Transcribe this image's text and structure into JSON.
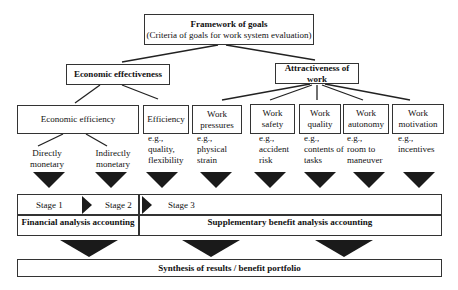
{
  "top": {
    "title": "Framework of goals",
    "subtitle": "(Criteria of goals for work system evaluation)"
  },
  "level2": {
    "left": "Economic effectiveness",
    "right": "Attractiveness of work"
  },
  "level3": [
    {
      "label": "Economic efficiency"
    },
    {
      "label": "Efficiency",
      "example_prefix": "e.g.,",
      "example": "quality, flexibility"
    },
    {
      "label": "Work pressures",
      "example_prefix": "e.g.,",
      "example": "physical strain"
    },
    {
      "label": "Work safety",
      "example_prefix": "e.g.,",
      "example": "accident risk"
    },
    {
      "label": "Work quality",
      "example_prefix": "e.g.,",
      "example": "contents of tasks"
    },
    {
      "label": "Work autonomy",
      "example_prefix": "e.g.,",
      "example": "room to maneuver"
    },
    {
      "label": "Work motivation",
      "example_prefix": "e.g.,",
      "example": "incentives"
    }
  ],
  "econ_sub": {
    "direct": "Directly monetary",
    "indirect": "Indirectly monetary"
  },
  "stages": {
    "stage1": "Stage 1",
    "stage2": "Stage 2",
    "stage3": "Stage 3",
    "financial": "Financial analysis accounting",
    "supplementary": "Supplementary benefit analysis accounting"
  },
  "synthesis": "Synthesis of results / benefit portfolio"
}
